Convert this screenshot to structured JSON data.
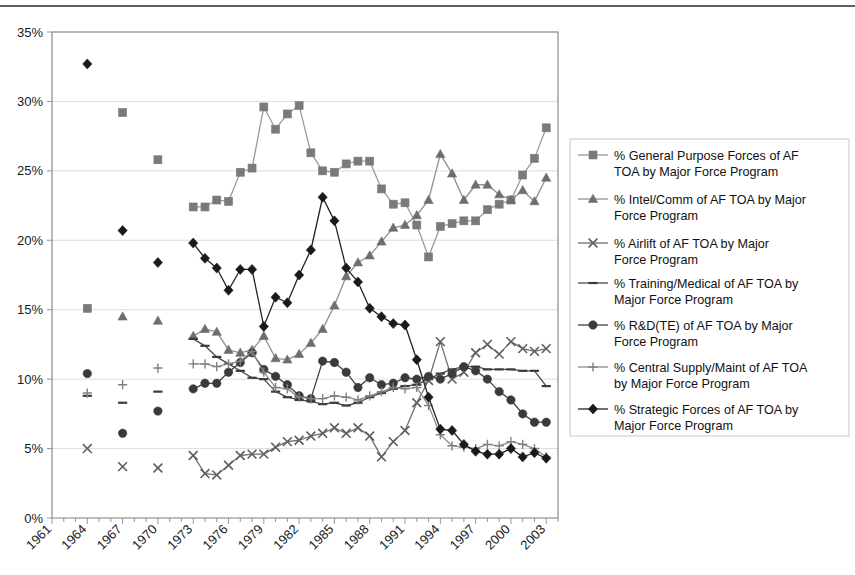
{
  "chart_data": {
    "type": "line",
    "title": "",
    "subtitle": "",
    "xlabel": "",
    "ylabel": "",
    "grid": true,
    "legend_position": "right",
    "xlim": [
      1961,
      2004
    ],
    "ylim": [
      0,
      35
    ],
    "ytick_labels": [
      "0%",
      "5%",
      "10%",
      "15%",
      "20%",
      "25%",
      "30%",
      "35%"
    ],
    "ytick_values": [
      0,
      5,
      10,
      15,
      20,
      25,
      30,
      35
    ],
    "xtick_labels": [
      "1961",
      "1964",
      "1967",
      "1970",
      "1973",
      "1976",
      "1979",
      "1982",
      "1985",
      "1988",
      "1991",
      "1994",
      "1997",
      "2000",
      "2003"
    ],
    "xtick_values": [
      1961,
      1964,
      1967,
      1970,
      1973,
      1976,
      1979,
      1982,
      1985,
      1988,
      1991,
      1994,
      1997,
      2000,
      2003
    ],
    "xtick_minor_step": 1,
    "series": [
      {
        "name": "% General Purpose Forces of AF TOA by Major Force Program",
        "marker": "square",
        "color": "#7a7a7a",
        "line_color": "#9a9a9a",
        "x": [
          1964,
          1967,
          1970,
          1973,
          1974,
          1975,
          1976,
          1977,
          1978,
          1979,
          1980,
          1981,
          1982,
          1983,
          1984,
          1985,
          1986,
          1987,
          1988,
          1989,
          1990,
          1991,
          1992,
          1993,
          1994,
          1995,
          1996,
          1997,
          1998,
          1999,
          2000,
          2001,
          2002,
          2003
        ],
        "y": [
          15.1,
          29.2,
          25.8,
          22.4,
          22.4,
          22.9,
          22.8,
          24.9,
          25.2,
          29.6,
          28.0,
          29.1,
          29.7,
          26.3,
          25.0,
          24.9,
          25.5,
          25.7,
          25.7,
          23.7,
          22.6,
          22.7,
          21.1,
          18.8,
          21.0,
          21.2,
          21.4,
          21.4,
          22.2,
          22.6,
          22.9,
          24.7,
          25.9,
          28.1
        ]
      },
      {
        "name": "% Intel/Comm of AF TOA by Major Force Program",
        "marker": "triangle",
        "color": "#6e6e6e",
        "line_color": "#909090",
        "x": [
          1967,
          1970,
          1973,
          1974,
          1975,
          1976,
          1977,
          1978,
          1979,
          1980,
          1981,
          1982,
          1983,
          1984,
          1985,
          1986,
          1987,
          1988,
          1989,
          1990,
          1991,
          1992,
          1993,
          1994,
          1995,
          1996,
          1997,
          1998,
          1999,
          2000,
          2001,
          2002,
          2003
        ],
        "y": [
          14.5,
          14.2,
          13.1,
          13.6,
          13.4,
          12.1,
          11.9,
          12.1,
          13.1,
          11.5,
          11.4,
          11.8,
          12.6,
          13.6,
          15.3,
          17.4,
          18.4,
          18.9,
          19.9,
          20.9,
          21.1,
          21.8,
          22.9,
          26.2,
          24.8,
          22.9,
          24.0,
          24.0,
          23.3,
          22.9,
          23.6,
          22.8,
          24.5
        ]
      },
      {
        "name": "% Airlift of AF TOA by Major Force Program",
        "marker": "x",
        "color": "#5e5e5e",
        "line_color": "#6f6f6f",
        "x": [
          1964,
          1967,
          1970,
          1973,
          1974,
          1975,
          1976,
          1977,
          1978,
          1979,
          1980,
          1981,
          1982,
          1983,
          1984,
          1985,
          1986,
          1987,
          1988,
          1989,
          1990,
          1991,
          1992,
          1993,
          1994,
          1995,
          1996,
          1997,
          1998,
          1999,
          2000,
          2001,
          2002,
          2003
        ],
        "y": [
          5.0,
          3.7,
          3.6,
          4.5,
          3.2,
          3.1,
          3.8,
          4.5,
          4.6,
          4.6,
          5.1,
          5.5,
          5.6,
          5.9,
          6.1,
          6.5,
          6.1,
          6.5,
          5.9,
          4.4,
          5.5,
          6.3,
          8.3,
          9.9,
          12.7,
          10.0,
          10.5,
          11.9,
          12.5,
          11.8,
          12.7,
          12.2,
          12.0,
          12.2
        ]
      },
      {
        "name": "% Training/Medical of AF TOA by Major Force Program",
        "marker": "dash",
        "color": "#3c3c3c",
        "line_color": "#4a4a4a",
        "x": [
          1964,
          1967,
          1970,
          1973,
          1974,
          1975,
          1976,
          1977,
          1978,
          1979,
          1980,
          1981,
          1982,
          1983,
          1984,
          1985,
          1986,
          1987,
          1988,
          1989,
          1990,
          1991,
          1992,
          1993,
          1994,
          1995,
          1996,
          1997,
          1998,
          1999,
          2000,
          2001,
          2002,
          2003
        ],
        "y": [
          8.8,
          8.3,
          9.1,
          12.9,
          12.4,
          11.6,
          11.1,
          10.6,
          10.1,
          10.0,
          9.1,
          8.7,
          8.5,
          8.4,
          8.2,
          8.3,
          8.1,
          8.3,
          8.7,
          9.0,
          9.3,
          9.5,
          9.6,
          10.0,
          10.4,
          10.7,
          10.9,
          10.9,
          10.7,
          10.7,
          10.7,
          10.6,
          10.6,
          9.5
        ]
      },
      {
        "name": "% R&D(TE) of AF TOA by Major Force Program",
        "marker": "circle",
        "color": "#3a3a3a",
        "line_color": "#404040",
        "x": [
          1964,
          1967,
          1970,
          1973,
          1974,
          1975,
          1976,
          1977,
          1978,
          1979,
          1980,
          1981,
          1982,
          1983,
          1984,
          1985,
          1986,
          1987,
          1988,
          1989,
          1990,
          1991,
          1992,
          1993,
          1994,
          1995,
          1996,
          1997,
          1998,
          1999,
          2000,
          2001,
          2002,
          2003
        ],
        "y": [
          10.4,
          6.1,
          7.7,
          9.3,
          9.7,
          9.7,
          10.5,
          11.2,
          11.9,
          10.7,
          10.2,
          9.6,
          8.8,
          8.6,
          11.3,
          11.2,
          10.5,
          9.4,
          10.1,
          9.6,
          9.7,
          10.1,
          10.0,
          10.2,
          10.0,
          10.4,
          10.9,
          10.6,
          10.0,
          9.1,
          8.5,
          7.5,
          6.9,
          6.9
        ]
      },
      {
        "name": "% Central Supply/Maint of AF TOA by Major Force Program",
        "marker": "plus",
        "color": "#808080",
        "line_color": "#8c8c8c",
        "x": [
          1964,
          1967,
          1970,
          1973,
          1974,
          1975,
          1976,
          1977,
          1978,
          1979,
          1980,
          1981,
          1982,
          1983,
          1984,
          1985,
          1986,
          1987,
          1988,
          1989,
          1990,
          1991,
          1992,
          1993,
          1994,
          1995,
          1996,
          1997,
          1998,
          1999,
          2000,
          2001,
          2002,
          2003
        ],
        "y": [
          9.0,
          9.6,
          10.8,
          11.1,
          11.1,
          10.9,
          11.1,
          11.3,
          12.0,
          10.5,
          9.4,
          9.3,
          8.7,
          8.6,
          8.6,
          8.8,
          8.7,
          8.5,
          8.8,
          9.1,
          9.4,
          9.3,
          9.4,
          8.1,
          6.0,
          5.2,
          5.1,
          5.0,
          5.3,
          5.2,
          5.5,
          5.3,
          5.0,
          4.4
        ]
      },
      {
        "name": "% Strategic Forces of AF TOA by Major Force Program",
        "marker": "diamond",
        "color": "#1a1a1a",
        "line_color": "#222222",
        "x": [
          1964,
          1967,
          1970,
          1973,
          1974,
          1975,
          1976,
          1977,
          1978,
          1979,
          1980,
          1981,
          1982,
          1983,
          1984,
          1985,
          1986,
          1987,
          1988,
          1989,
          1990,
          1991,
          1992,
          1993,
          1994,
          1995,
          1996,
          1997,
          1998,
          1999,
          2000,
          2001,
          2002,
          2003
        ],
        "y": [
          32.7,
          20.7,
          18.4,
          19.8,
          18.7,
          18.0,
          16.4,
          17.9,
          17.9,
          13.8,
          15.9,
          15.5,
          17.5,
          19.3,
          23.1,
          21.4,
          18.0,
          17.0,
          15.1,
          14.5,
          14.0,
          13.9,
          11.4,
          8.7,
          6.4,
          6.3,
          5.3,
          4.8,
          4.6,
          4.6,
          5.0,
          4.4,
          4.7,
          4.3
        ]
      }
    ]
  },
  "legend": {
    "entries": [
      "% General Purpose Forces of AF TOA by Major Force Program",
      "% Intel/Comm of AF TOA by Major Force Program",
      "% Airlift of AF TOA by Major Force Program",
      "% Training/Medical of AF TOA by Major Force Program",
      "% R&D(TE) of AF TOA by Major Force Program",
      "% Central Supply/Maint of AF TOA by Major Force Program",
      "% Strategic Forces of AF TOA by Major Force Program"
    ]
  }
}
